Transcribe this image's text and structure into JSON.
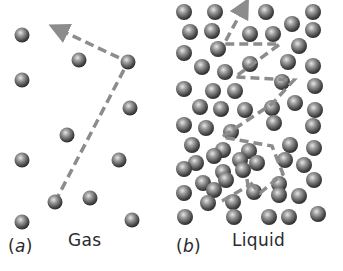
{
  "figure": {
    "panels": [
      {
        "id": "a",
        "label": "(a)",
        "letter": "a",
        "title": "Gas",
        "molecules": [
          [
            22,
            35
          ],
          [
            79,
            60
          ],
          [
            128,
            62
          ],
          [
            22,
            80
          ],
          [
            130,
            108
          ],
          [
            67,
            135
          ],
          [
            22,
            160
          ],
          [
            119,
            160
          ],
          [
            55,
            202
          ],
          [
            90,
            198
          ],
          [
            22,
            222
          ],
          [
            132,
            220
          ]
        ],
        "path": [
          [
            55,
            202
          ],
          [
            128,
            62
          ],
          [
            58,
            29
          ]
        ]
      },
      {
        "id": "b",
        "label": "(b)",
        "letter": "b",
        "title": "Liquid",
        "molecules": [
          [
            184,
            12
          ],
          [
            215,
            12
          ],
          [
            266,
            12
          ],
          [
            313,
            12
          ],
          [
            190,
            32
          ],
          [
            212,
            31
          ],
          [
            250,
            34
          ],
          [
            273,
            34
          ],
          [
            292,
            24
          ],
          [
            313,
            30
          ],
          [
            184,
            53
          ],
          [
            218,
            49
          ],
          [
            299,
            46
          ],
          [
            202,
            67
          ],
          [
            225,
            72
          ],
          [
            250,
            64
          ],
          [
            288,
            62
          ],
          [
            313,
            66
          ],
          [
            184,
            89
          ],
          [
            213,
            91
          ],
          [
            235,
            91
          ],
          [
            282,
            82
          ],
          [
            315,
            86
          ],
          [
            200,
            107
          ],
          [
            221,
            109
          ],
          [
            245,
            110
          ],
          [
            272,
            108
          ],
          [
            295,
            103
          ],
          [
            315,
            110
          ],
          [
            184,
            125
          ],
          [
            206,
            128
          ],
          [
            231,
            132
          ],
          [
            274,
            123
          ],
          [
            313,
            126
          ],
          [
            192,
            145
          ],
          [
            223,
            150
          ],
          [
            249,
            151
          ],
          [
            290,
            145
          ],
          [
            314,
            148
          ],
          [
            214,
            156
          ],
          [
            196,
            163
          ],
          [
            240,
            160
          ],
          [
            257,
            163
          ],
          [
            285,
            160
          ],
          [
            184,
            169
          ],
          [
            223,
            172
          ],
          [
            243,
            170
          ],
          [
            304,
            165
          ],
          [
            203,
            183
          ],
          [
            226,
            180
          ],
          [
            279,
            184
          ],
          [
            314,
            180
          ],
          [
            184,
            193
          ],
          [
            214,
            190
          ],
          [
            233,
            202
          ],
          [
            254,
            192
          ],
          [
            279,
            195
          ],
          [
            299,
            196
          ],
          [
            185,
            217
          ],
          [
            234,
            217
          ],
          [
            269,
            217
          ],
          [
            289,
            217
          ],
          [
            318,
            214
          ],
          [
            208,
            203
          ]
        ],
        "path": [
          [
            222,
            201
          ],
          [
            248,
            186
          ],
          [
            247,
            179
          ],
          [
            260,
            193
          ],
          [
            283,
            174
          ],
          [
            272,
            146
          ],
          [
            222,
            137
          ],
          [
            272,
            104
          ],
          [
            294,
            80
          ],
          [
            235,
            77
          ],
          [
            280,
            44
          ],
          [
            224,
            44
          ],
          [
            244,
            7
          ]
        ]
      }
    ],
    "colors": {
      "molecule_light": "#c8c8c8",
      "molecule_dark": "#3c3c3c",
      "path": "#8c8c8c",
      "text": "#2a2a2a"
    }
  }
}
